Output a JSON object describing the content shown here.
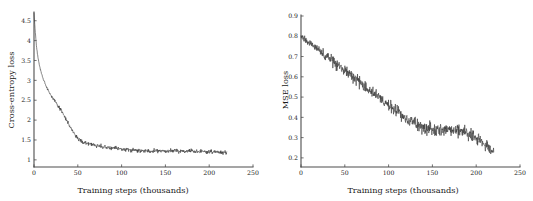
{
  "figure": {
    "background_color": "#ffffff",
    "curve_color": "#3a3a3a",
    "axis_color": "#4d4d4d",
    "panel_count": 2
  },
  "chart_data": [
    {
      "type": "line",
      "panel": "left",
      "title": "",
      "xlabel": "Training steps (thousands)",
      "ylabel": "Cross-entropy loss",
      "xlim": [
        0,
        250
      ],
      "ylim": [
        0.82,
        4.72
      ],
      "grid": false,
      "legend": null,
      "xticks": [
        0,
        50,
        100,
        150,
        200,
        250
      ],
      "xtick_labels": [
        "0",
        "50",
        "100",
        "150",
        "200",
        "250"
      ],
      "yticks": [
        1,
        1.5,
        2,
        2.5,
        3,
        3.5,
        4,
        4.5
      ],
      "ytick_labels": [
        "1",
        "1.5",
        "2",
        "2.5",
        "3",
        "3.5",
        "4",
        "4.5"
      ],
      "series": [
        {
          "name": "cross-entropy loss",
          "x": [
            0,
            1.5,
            3,
            4.5,
            6,
            7.5,
            9,
            10.5,
            12,
            13.5,
            15,
            16.5,
            18,
            19.5,
            21,
            22.5,
            24,
            25.5,
            27,
            28.5,
            30,
            31.5,
            33,
            34.5,
            36,
            37.5,
            39,
            40.5,
            42,
            43.5,
            45,
            46.5,
            48,
            49.5,
            51,
            52.5,
            54,
            55.5,
            57,
            58.5,
            60,
            61.5,
            63,
            64.5,
            66,
            67.5,
            69,
            70.5,
            72,
            73.5,
            75,
            76.5,
            78,
            79.5,
            81,
            82.5,
            84,
            85.5,
            87,
            88.5,
            90,
            91.5,
            93,
            94.5,
            96,
            97.5,
            99,
            100.5,
            102,
            103.5,
            105,
            106.5,
            108,
            109.5,
            111,
            112.5,
            114,
            115.5,
            117,
            118.5,
            120,
            121.5,
            123,
            124.5,
            126,
            127.5,
            129,
            130.5,
            132,
            133.5,
            135,
            136.5,
            138,
            139.5,
            141,
            142.5,
            144,
            145.5,
            147,
            148.5,
            150,
            151.5,
            153,
            154.5,
            156,
            157.5,
            159,
            160.5,
            162,
            163.5,
            165,
            166.5,
            168,
            169.5,
            171,
            172.5,
            174,
            175.5,
            177,
            178.5,
            180,
            181.5,
            183,
            184.5,
            186,
            187.5,
            189,
            190.5,
            192,
            193.5,
            195,
            196.5,
            198,
            199.5,
            201,
            202.5,
            204,
            205.5,
            207,
            208.5,
            210,
            211.5,
            213,
            214.5,
            216,
            217.5,
            219,
            220
          ],
          "y": [
            4.7,
            4.2,
            3.82,
            3.58,
            3.4,
            3.26,
            3.14,
            3.04,
            2.95,
            2.87,
            2.8,
            2.74,
            2.68,
            2.62,
            2.57,
            2.52,
            2.47,
            2.43,
            2.38,
            2.33,
            2.28,
            2.22,
            2.16,
            2.1,
            2.04,
            1.98,
            1.92,
            1.86,
            1.8,
            1.74,
            1.69,
            1.64,
            1.6,
            1.56,
            1.53,
            1.5,
            1.48,
            1.46,
            1.44,
            1.43,
            1.42,
            1.41,
            1.4,
            1.39,
            1.38,
            1.38,
            1.37,
            1.36,
            1.35,
            1.35,
            1.34,
            1.34,
            1.33,
            1.33,
            1.32,
            1.32,
            1.31,
            1.31,
            1.3,
            1.3,
            1.29,
            1.29,
            1.29,
            1.28,
            1.28,
            1.28,
            1.27,
            1.27,
            1.27,
            1.26,
            1.26,
            1.26,
            1.26,
            1.25,
            1.25,
            1.25,
            1.25,
            1.25,
            1.24,
            1.24,
            1.24,
            1.24,
            1.24,
            1.24,
            1.24,
            1.23,
            1.23,
            1.23,
            1.23,
            1.23,
            1.23,
            1.23,
            1.23,
            1.23,
            1.23,
            1.23,
            1.23,
            1.23,
            1.23,
            1.23,
            1.23,
            1.23,
            1.23,
            1.23,
            1.23,
            1.23,
            1.23,
            1.23,
            1.23,
            1.23,
            1.22,
            1.22,
            1.22,
            1.22,
            1.22,
            1.22,
            1.22,
            1.22,
            1.22,
            1.22,
            1.22,
            1.22,
            1.21,
            1.21,
            1.21,
            1.21,
            1.21,
            1.21,
            1.21,
            1.21,
            1.21,
            1.2,
            1.2,
            1.2,
            1.2,
            1.2,
            1.2,
            1.2,
            1.2,
            1.2,
            1.19,
            1.19,
            1.19,
            1.19,
            1.19,
            1.18,
            1.18,
            1.18,
            1.17
          ],
          "noise_amplitude": 0.035
        }
      ]
    },
    {
      "type": "line",
      "panel": "right",
      "title": "",
      "xlabel": "Training steps (thousands)",
      "ylabel": "MSE loss",
      "xlim": [
        0,
        250
      ],
      "ylim": [
        0.155,
        0.905
      ],
      "grid": false,
      "legend": null,
      "xticks": [
        0,
        50,
        100,
        150,
        200,
        250
      ],
      "xtick_labels": [
        "0",
        "50",
        "100",
        "150",
        "200",
        "250"
      ],
      "yticks": [
        0.2,
        0.3,
        0.4,
        0.5,
        0.6,
        0.7,
        0.8,
        0.9
      ],
      "ytick_labels": [
        "0.2",
        "0.3",
        "0.4",
        "0.5",
        "0.6",
        "0.7",
        "0.8",
        "0.9"
      ],
      "series": [
        {
          "name": "MSE loss",
          "x": [
            0,
            1.5,
            3,
            4.5,
            6,
            7.5,
            9,
            10.5,
            12,
            13.5,
            15,
            16.5,
            18,
            19.5,
            21,
            22.5,
            24,
            25.5,
            27,
            28.5,
            30,
            31.5,
            33,
            34.5,
            36,
            37.5,
            39,
            40.5,
            42,
            43.5,
            45,
            46.5,
            48,
            49.5,
            51,
            52.5,
            54,
            55.5,
            57,
            58.5,
            60,
            61.5,
            63,
            64.5,
            66,
            67.5,
            69,
            70.5,
            72,
            73.5,
            75,
            76.5,
            78,
            79.5,
            81,
            82.5,
            84,
            85.5,
            87,
            88.5,
            90,
            91.5,
            93,
            94.5,
            96,
            97.5,
            99,
            100.5,
            102,
            103.5,
            105,
            106.5,
            108,
            109.5,
            111,
            112.5,
            114,
            115.5,
            117,
            118.5,
            120,
            121.5,
            123,
            124.5,
            126,
            127.5,
            129,
            130.5,
            132,
            133.5,
            135,
            136.5,
            138,
            139.5,
            141,
            142.5,
            144,
            145.5,
            147,
            148.5,
            150,
            151.5,
            153,
            154.5,
            156,
            157.5,
            159,
            160.5,
            162,
            163.5,
            165,
            166.5,
            168,
            169.5,
            171,
            172.5,
            174,
            175.5,
            177,
            178.5,
            180,
            181.5,
            183,
            184.5,
            186,
            187.5,
            189,
            190.5,
            192,
            193.5,
            195,
            196.5,
            198,
            199.5,
            201,
            202.5,
            204,
            205.5,
            207,
            208.5,
            210,
            211.5,
            213,
            214.5,
            216,
            217.5,
            219,
            220
          ],
          "y": [
            0.8,
            0.795,
            0.789,
            0.784,
            0.779,
            0.774,
            0.769,
            0.764,
            0.759,
            0.754,
            0.749,
            0.744,
            0.739,
            0.734,
            0.729,
            0.724,
            0.719,
            0.714,
            0.709,
            0.704,
            0.699,
            0.694,
            0.689,
            0.684,
            0.678,
            0.673,
            0.668,
            0.663,
            0.658,
            0.653,
            0.648,
            0.643,
            0.638,
            0.633,
            0.628,
            0.623,
            0.618,
            0.613,
            0.608,
            0.603,
            0.598,
            0.593,
            0.587,
            0.582,
            0.577,
            0.572,
            0.567,
            0.562,
            0.557,
            0.552,
            0.547,
            0.542,
            0.537,
            0.532,
            0.527,
            0.522,
            0.517,
            0.512,
            0.507,
            0.502,
            0.496,
            0.491,
            0.486,
            0.481,
            0.476,
            0.471,
            0.466,
            0.461,
            0.456,
            0.451,
            0.446,
            0.441,
            0.436,
            0.431,
            0.426,
            0.421,
            0.416,
            0.411,
            0.406,
            0.401,
            0.396,
            0.392,
            0.388,
            0.384,
            0.38,
            0.376,
            0.372,
            0.369,
            0.366,
            0.363,
            0.36,
            0.357,
            0.355,
            0.353,
            0.351,
            0.349,
            0.348,
            0.347,
            0.346,
            0.345,
            0.344,
            0.344,
            0.343,
            0.343,
            0.343,
            0.343,
            0.343,
            0.343,
            0.343,
            0.343,
            0.342,
            0.342,
            0.342,
            0.341,
            0.34,
            0.339,
            0.338,
            0.337,
            0.336,
            0.335,
            0.334,
            0.333,
            0.331,
            0.329,
            0.327,
            0.325,
            0.322,
            0.319,
            0.316,
            0.313,
            0.31,
            0.306,
            0.302,
            0.298,
            0.294,
            0.29,
            0.286,
            0.282,
            0.277,
            0.272,
            0.267,
            0.262,
            0.257,
            0.252,
            0.247,
            0.242,
            0.237,
            0.232
          ],
          "noise_amplitude": 0.022
        }
      ]
    }
  ]
}
